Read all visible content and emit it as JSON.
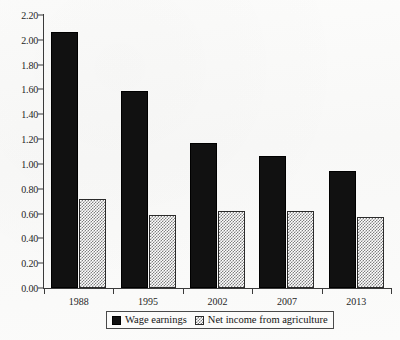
{
  "chart_data": {
    "type": "bar",
    "title": "",
    "subtitle": "",
    "xlabel": "",
    "ylabel": "",
    "categories": [
      "1988",
      "1995",
      "2002",
      "2007",
      "2013"
    ],
    "series": [
      {
        "name": "Wage earnings",
        "color": "#111111",
        "pattern": "solid-black",
        "values": [
          2.06,
          1.59,
          1.17,
          1.06,
          0.94
        ]
      },
      {
        "name": "Net income from agriculture",
        "color": "#808080",
        "pattern": "checkerboard-gray",
        "values": [
          0.72,
          0.59,
          0.62,
          0.62,
          0.57
        ]
      }
    ],
    "ylim": [
      0.0,
      2.2
    ],
    "ytick_step": 0.2,
    "ytick_labels": [
      "0.00",
      "0.20",
      "0.40",
      "0.60",
      "0.80",
      "1.00",
      "1.20",
      "1.40",
      "1.60",
      "1.80",
      "2.00",
      "2.20"
    ],
    "ytick_values": [
      0.0,
      0.2,
      0.4,
      0.6,
      0.8,
      1.0,
      1.2,
      1.4,
      1.6,
      1.8,
      2.0,
      2.2
    ],
    "grid": false,
    "legend_position": "bottom-center",
    "legend_entries": [
      "Wage earnings",
      "Net income from agriculture"
    ],
    "annotations": []
  }
}
